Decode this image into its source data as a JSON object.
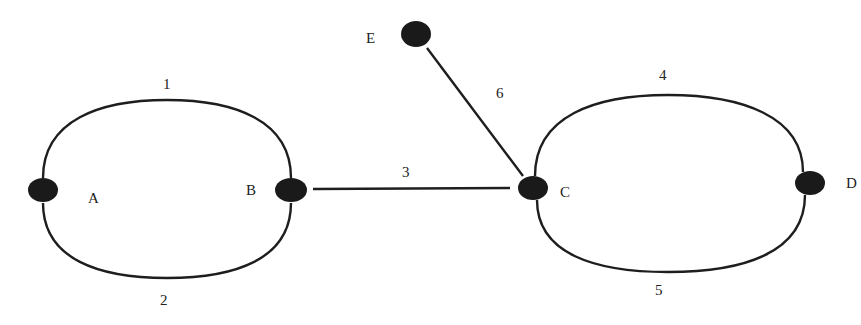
{
  "diagram": {
    "type": "graph",
    "colors": {
      "background": "#ffffff",
      "stroke": "#1e1e1e",
      "node_fill": "#1a1a1a",
      "text": "#222222"
    },
    "nodes": [
      {
        "id": "A",
        "label": "A",
        "x": 43,
        "y": 190,
        "label_x": 88,
        "label_y": 203
      },
      {
        "id": "B",
        "label": "B",
        "x": 291,
        "y": 190,
        "label_x": 246,
        "label_y": 195
      },
      {
        "id": "C",
        "label": "C",
        "x": 533,
        "y": 188,
        "label_x": 560,
        "label_y": 197
      },
      {
        "id": "D",
        "label": "D",
        "x": 810,
        "y": 183,
        "label_x": 846,
        "label_y": 188
      },
      {
        "id": "E",
        "label": "E",
        "x": 416,
        "y": 34,
        "label_x": 366,
        "label_y": 43
      }
    ],
    "edges": [
      {
        "id": "1",
        "label": "1",
        "from": "A",
        "to": "B",
        "shape": "upper-arc",
        "label_x": 163,
        "label_y": 89
      },
      {
        "id": "2",
        "label": "2",
        "from": "A",
        "to": "B",
        "shape": "lower-arc",
        "label_x": 160,
        "label_y": 305
      },
      {
        "id": "3",
        "label": "3",
        "from": "B",
        "to": "C",
        "shape": "line",
        "label_x": 402,
        "label_y": 177
      },
      {
        "id": "4",
        "label": "4",
        "from": "C",
        "to": "D",
        "shape": "upper-arc",
        "label_x": 659,
        "label_y": 80
      },
      {
        "id": "5",
        "label": "5",
        "from": "C",
        "to": "D",
        "shape": "lower-arc",
        "label_x": 655,
        "label_y": 295
      },
      {
        "id": "6",
        "label": "6",
        "from": "E",
        "to": "C",
        "shape": "line",
        "label_x": 496,
        "label_y": 98
      }
    ]
  }
}
